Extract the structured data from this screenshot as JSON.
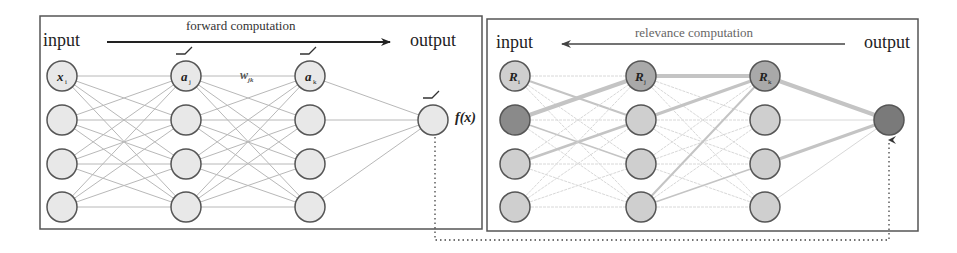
{
  "left_panel": {
    "input_label": "input",
    "output_label": "output",
    "caption": "forward computation",
    "arrow_direction": "right",
    "output_fn_label": "f(x)",
    "weight_label": "w",
    "weight_sub": "jk",
    "node_labels": [
      {
        "main": "x",
        "sub": "i"
      },
      {
        "main": "a",
        "sub": "j"
      },
      {
        "main": "a",
        "sub": "k"
      }
    ],
    "activation_icon": "relu-icon"
  },
  "right_panel": {
    "input_label": "input",
    "output_label": "output",
    "caption": "relevance computation",
    "arrow_direction": "left",
    "node_labels": [
      {
        "main": "R",
        "sub": "i"
      },
      {
        "main": "R",
        "sub": "j"
      },
      {
        "main": "R",
        "sub": "k"
      }
    ]
  },
  "connector": {
    "style": "dotted",
    "description": "links output f(x) of forward network to output node of relevance network"
  },
  "colors": {
    "node_fill": "#e8e8e8",
    "node_stroke": "#555555",
    "edge": "#b8b8b8",
    "rel_light": "#cfcfcf",
    "rel_mid": "#a9a9a9",
    "rel_dark": "#8a8a8a",
    "rel_edge": "#cccccc",
    "box": "#555555"
  }
}
